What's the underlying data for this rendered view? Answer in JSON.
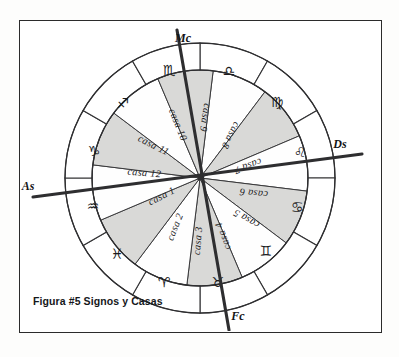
{
  "figure": {
    "caption": "Figura #5 Signos y Casas",
    "background_color": "#ffffff",
    "frame_color": "#2b2b2b",
    "ink_color": "#2e2e30",
    "shade_color": "#d9d9d7"
  },
  "chart_data": {
    "type": "pie",
    "title": "Figura #5 Signos y Casas",
    "subtitle": "Rueda astrologica dibujada a mano: anillo exterior de signos, rueda interior de casas",
    "xlabel": "",
    "ylabel": "",
    "legend_position": "none",
    "grid": false,
    "center": {
      "x": 200,
      "y": 178
    },
    "radii": {
      "outer_ring_outer": 135,
      "outer_ring_inner": 108,
      "house_wheel": 108,
      "hub": 3
    },
    "rings": [
      {
        "name": "signos",
        "role": "outer-ring",
        "slice_count": 12,
        "slice_degrees": 30,
        "start_offset_degrees": 0,
        "categories": [
          "Aries",
          "Tauro",
          "Geminis",
          "Cancer",
          "Leo",
          "Virgo",
          "Libra",
          "Escorpio",
          "Sagitario",
          "Capricornio",
          "Acuario",
          "Piscis"
        ],
        "values": [
          30,
          30,
          30,
          30,
          30,
          30,
          30,
          30,
          30,
          30,
          30,
          30
        ],
        "glyphs": [
          "♈",
          "♉",
          "♊",
          "♋",
          "♌",
          "♍",
          "♎",
          "♏",
          "♐",
          "♑",
          "♒",
          "♓"
        ]
      },
      {
        "name": "casas",
        "role": "inner-wheel",
        "slice_count": 12,
        "slice_degrees": 30,
        "rotation_degrees": 7,
        "categories": [
          "casa 1",
          "casa 2",
          "casa 3",
          "casa 4",
          "casa 5",
          "casa 6",
          "casa 7",
          "casa 8",
          "casa 9",
          "casa 10",
          "casa 11",
          "casa 12"
        ],
        "values": [
          30,
          30,
          30,
          30,
          30,
          30,
          30,
          30,
          30,
          30,
          30,
          30
        ],
        "shaded": [
          false,
          true,
          false,
          true,
          false,
          true,
          false,
          true,
          false,
          true,
          false,
          true
        ]
      }
    ],
    "annotations": [
      {
        "name": "Mc",
        "label": "Mc",
        "meaning": "Medio Cielo",
        "position": "top"
      },
      {
        "name": "Ds",
        "label": "Ds",
        "meaning": "Descendente",
        "position": "right"
      },
      {
        "name": "Fc",
        "label": "Fc",
        "meaning": "Fondo del Cielo",
        "position": "bottom"
      },
      {
        "name": "As",
        "label": "As",
        "meaning": "Ascendente",
        "position": "left"
      }
    ],
    "axes": [
      {
        "name": "mc-fc-axis",
        "from": "Mc",
        "to": "Fc",
        "tilt_degrees": 7
      },
      {
        "name": "as-ds-axis",
        "from": "As",
        "to": "Ds",
        "tilt_degrees": 7
      }
    ]
  },
  "signs": [
    {
      "id": "sign-scorpio",
      "glyph": "♏",
      "label": "Escorpio",
      "index": 0,
      "x": 169,
      "y": 71
    },
    {
      "id": "sign-libra",
      "glyph": "♎",
      "label": "Libra",
      "index": 1,
      "x": 229,
      "y": 72
    },
    {
      "id": "sign-virgo",
      "glyph": "♍",
      "label": "Virgo",
      "index": 2,
      "x": 277,
      "y": 103
    },
    {
      "id": "sign-leo",
      "glyph": "♌",
      "label": "Leo",
      "index": 3,
      "x": 300,
      "y": 153
    },
    {
      "id": "sign-cancer",
      "glyph": "♋",
      "label": "Cancer",
      "index": 4,
      "x": 297,
      "y": 208
    },
    {
      "id": "sign-gemini",
      "glyph": "♊",
      "label": "Geminis",
      "index": 5,
      "x": 266,
      "y": 252
    },
    {
      "id": "sign-taurus",
      "glyph": "♉",
      "label": "Tauro",
      "index": 6,
      "x": 218,
      "y": 283
    },
    {
      "id": "sign-aries",
      "glyph": "♈",
      "label": "Aries",
      "index": 7,
      "x": 164,
      "y": 283
    },
    {
      "id": "sign-pisces",
      "glyph": "♓",
      "label": "Piscis",
      "index": 8,
      "x": 117,
      "y": 255
    },
    {
      "id": "sign-aquarius",
      "glyph": "♒",
      "label": "Acuario",
      "index": 9,
      "x": 93,
      "y": 207
    },
    {
      "id": "sign-capricorn",
      "glyph": "♑",
      "label": "Capricornio",
      "index": 10,
      "x": 94,
      "y": 152
    },
    {
      "id": "sign-sagittarius",
      "glyph": "♐",
      "label": "Sagitario",
      "index": 11,
      "x": 123,
      "y": 104
    }
  ],
  "houses": [
    {
      "id": "house-1",
      "label": "casa 1",
      "x": 163,
      "y": 199,
      "rotate": -27
    },
    {
      "id": "house-2",
      "label": "casa 2",
      "x": 178,
      "y": 228,
      "rotate": -68
    },
    {
      "id": "house-3",
      "label": "casa 3",
      "x": 201,
      "y": 241,
      "rotate": -85
    },
    {
      "id": "house-4",
      "label": "casa 4",
      "x": 226,
      "y": 235,
      "rotate": -110
    },
    {
      "id": "house-5",
      "label": "casa 5",
      "x": 248,
      "y": 216,
      "rotate": -150
    },
    {
      "id": "house-6",
      "label": "casa 6",
      "x": 254,
      "y": 190,
      "rotate": -174
    },
    {
      "id": "house-7",
      "label": "casa 7",
      "x": 247,
      "y": 163,
      "rotate": 160
    },
    {
      "id": "house-8",
      "label": "casa 8",
      "x": 228,
      "y": 134,
      "rotate": 117
    },
    {
      "id": "house-9",
      "label": "casa 9",
      "x": 202,
      "y": 117,
      "rotate": 99
    },
    {
      "id": "house-10",
      "label": "casa 10",
      "x": 175,
      "y": 126,
      "rotate": 68
    },
    {
      "id": "house-11",
      "label": "casa 11",
      "x": 152,
      "y": 148,
      "rotate": 27
    },
    {
      "id": "house-12",
      "label": "casa 12",
      "x": 144,
      "y": 176,
      "rotate": 5
    }
  ],
  "axis_labels": [
    {
      "id": "axis-label-mc",
      "label": "Mc",
      "x": 183,
      "y": 42
    },
    {
      "id": "axis-label-ds",
      "label": "Ds",
      "x": 340,
      "y": 148
    },
    {
      "id": "axis-label-fc",
      "label": "Fc",
      "x": 238,
      "y": 320
    },
    {
      "id": "axis-label-as",
      "label": "As",
      "x": 28,
      "y": 190
    }
  ]
}
